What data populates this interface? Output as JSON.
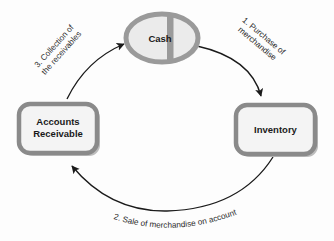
{
  "diagram": {
    "type": "cycle-diagram",
    "canvas": {
      "width": 334,
      "height": 241,
      "background": "#fdfdfd"
    },
    "colors": {
      "node_border": "#8a8a8a",
      "node_fill": "#f2f2f2",
      "node_shadow": "#bdbdbd",
      "ellipse_border": "#9a9a9a",
      "ellipse_fill": "#e8e8e8",
      "ellipse_divider": "#9a9a9a",
      "arrow": "#1a1a1a",
      "text": "#1a1a1a",
      "label_text": "#2b2b2b"
    },
    "nodes": [
      {
        "id": "cash",
        "shape": "ellipse",
        "label": "Cash",
        "cx": 162,
        "cy": 38,
        "rx": 36,
        "ry": 24,
        "font_size": 9.5
      },
      {
        "id": "accounts-receivable",
        "shape": "rounded-rect",
        "label_line1": "Accounts",
        "label_line2": "Receivable",
        "x": 19,
        "y": 104,
        "width": 78,
        "height": 49,
        "font_size": 9.5
      },
      {
        "id": "inventory",
        "shape": "rounded-rect",
        "label": "Inventory",
        "x": 236,
        "y": 105,
        "width": 79,
        "height": 49,
        "font_size": 9.5
      }
    ],
    "arrows": [
      {
        "id": "cash-to-inventory",
        "from": "cash",
        "to": "inventory",
        "step": 1,
        "label_line1": "1. Purchase of",
        "label_line2": "merchandise",
        "label_rotation_deg": 40
      },
      {
        "id": "inventory-to-accounts-receivable",
        "from": "inventory",
        "to": "accounts-receivable",
        "step": 2,
        "label": "2. Sale of merchandise on account",
        "label_curved": true
      },
      {
        "id": "accounts-receivable-to-cash",
        "from": "accounts-receivable",
        "to": "cash",
        "step": 3,
        "label_line1": "3. Collection of",
        "label_line2": "the receivables",
        "label_rotation_deg": -48
      }
    ]
  }
}
